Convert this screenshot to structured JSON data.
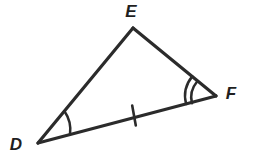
{
  "figure": {
    "type": "triangle-geometry-diagram",
    "background_color": "#ffffff",
    "stroke_color": "#2b2b2b",
    "stroke_width": 3.2,
    "mark_stroke_width": 2.4,
    "label_color": "#1f1f1f",
    "vertices": [
      {
        "id": "D",
        "label": "D",
        "x": 38,
        "y": 143,
        "label_x": 16,
        "label_y": 150
      },
      {
        "id": "E",
        "label": "E",
        "x": 133,
        "y": 28,
        "label_x": 131,
        "label_y": 17
      },
      {
        "id": "F",
        "label": "F",
        "x": 216,
        "y": 96,
        "label_x": 231,
        "label_y": 99
      }
    ],
    "sides": [
      {
        "id": "DE",
        "from": "D",
        "to": "E",
        "tick_count": 0
      },
      {
        "id": "EF",
        "from": "E",
        "to": "F",
        "tick_count": 0
      },
      {
        "id": "DF",
        "from": "D",
        "to": "F",
        "tick_count": 1
      }
    ],
    "angle_marks": [
      {
        "vertex": "D",
        "arc_count": 1,
        "radius": 32
      },
      {
        "vertex": "F",
        "arc_count": 2,
        "radius": 26
      }
    ],
    "tick_marks": [
      {
        "side": "DF",
        "x": 134,
        "y": 115,
        "length": 20,
        "angle_deg": 7
      }
    ],
    "congruence_note": {
      "equal_sides": "DF marked with a single tick",
      "angle_D_marks": 1,
      "angle_F_marks": 2
    }
  }
}
